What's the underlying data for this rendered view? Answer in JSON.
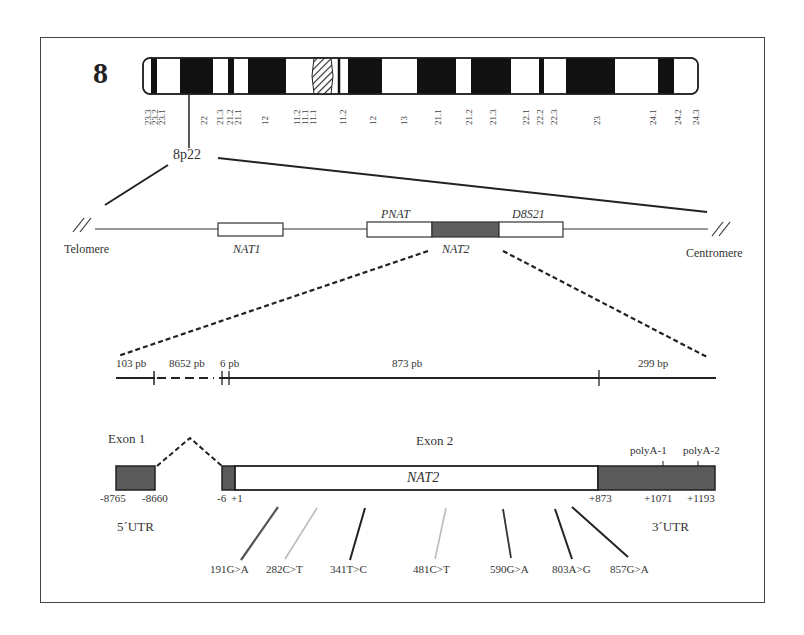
{
  "figure": {
    "chromosome_number": "8",
    "locus_label": "8p22",
    "band_labels": [
      {
        "label": "23.3",
        "x": 143
      },
      {
        "label": "23.2",
        "x": 150
      },
      {
        "label": "23.1",
        "x": 157
      },
      {
        "label": "22",
        "x": 199
      },
      {
        "label": "21.3",
        "x": 215
      },
      {
        "label": "21.2",
        "x": 225
      },
      {
        "label": "21.1",
        "x": 233
      },
      {
        "label": "12",
        "x": 260
      },
      {
        "label": "11.2",
        "x": 292
      },
      {
        "label": "11.1",
        "x": 300
      },
      {
        "label": "11.1",
        "x": 308
      },
      {
        "label": "11.2",
        "x": 338
      },
      {
        "label": "12",
        "x": 368
      },
      {
        "label": "13",
        "x": 399
      },
      {
        "label": "21.1",
        "x": 433
      },
      {
        "label": "21.2",
        "x": 464
      },
      {
        "label": "21.3",
        "x": 488
      },
      {
        "label": "22.1",
        "x": 521
      },
      {
        "label": "22.2",
        "x": 535
      },
      {
        "label": "22.3",
        "x": 549
      },
      {
        "label": "23",
        "x": 592
      },
      {
        "label": "24.1",
        "x": 648
      },
      {
        "label": "24.2",
        "x": 673
      },
      {
        "label": "24.3",
        "x": 691
      }
    ],
    "region_map": {
      "left_end": "Telomere",
      "right_end": "Centromere",
      "genes": [
        {
          "name": "NAT1",
          "italic": true
        },
        {
          "name": "PNAT",
          "italic": true
        },
        {
          "name": "NAT2",
          "italic": true
        },
        {
          "name": "D8S21",
          "italic": true
        }
      ]
    },
    "scale_line": {
      "segments": [
        {
          "label": "103 pb"
        },
        {
          "label": "8652 pb"
        },
        {
          "label": "6 pb"
        },
        {
          "label": "873 pb"
        },
        {
          "label": "299 bp"
        }
      ]
    },
    "gene_structure": {
      "exon1_label": "Exon 1",
      "exon2_label": "Exon 2",
      "gene_name": "NAT2",
      "polyA": [
        "polyA-1",
        "polyA-2"
      ],
      "positions": {
        "exon1_start": "-8765",
        "exon1_end": "-8660",
        "exon2_start": "-6",
        "cds_start": "+1",
        "cds_end": "+873",
        "polyA1_pos": "+1071",
        "polyA2_pos": "+1193"
      },
      "utr5_label": "5´UTR",
      "utr3_label": "3´UTR"
    },
    "snps": [
      {
        "label": "191G>A",
        "color": "#555555"
      },
      {
        "label": "282C>T",
        "color": "#bbbbbb"
      },
      {
        "label": "341T>C",
        "color": "#222222"
      },
      {
        "label": "481C>T",
        "color": "#bbbbbb"
      },
      {
        "label": "590G>A",
        "color": "#333333"
      },
      {
        "label": "803A>G",
        "color": "#222222"
      },
      {
        "label": "857G>A",
        "color": "#222222"
      }
    ],
    "colors": {
      "band_dark": "#111111",
      "utr_fill": "#5a5a5a",
      "nat2_fill": "#5e5e5e",
      "line": "#222222"
    }
  }
}
